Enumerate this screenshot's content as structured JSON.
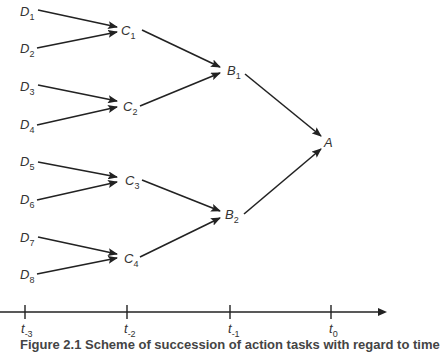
{
  "nodes": {
    "D1": {
      "base": "D",
      "sub": "1"
    },
    "D2": {
      "base": "D",
      "sub": "2"
    },
    "D3": {
      "base": "D",
      "sub": "3"
    },
    "D4": {
      "base": "D",
      "sub": "4"
    },
    "D5": {
      "base": "D",
      "sub": "5"
    },
    "D6": {
      "base": "D",
      "sub": "6"
    },
    "D7": {
      "base": "D",
      "sub": "7"
    },
    "D8": {
      "base": "D",
      "sub": "8"
    },
    "C1": {
      "base": "C",
      "sub": "1"
    },
    "C2": {
      "base": "C",
      "sub": "2"
    },
    "C3": {
      "base": "C",
      "sub": "3"
    },
    "C4": {
      "base": "C",
      "sub": "4"
    },
    "B1": {
      "base": "B",
      "sub": "1"
    },
    "B2": {
      "base": "B",
      "sub": "2"
    },
    "A": {
      "base": "A",
      "sub": ""
    }
  },
  "edges": [
    [
      "D1",
      "C1"
    ],
    [
      "D2",
      "C1"
    ],
    [
      "D3",
      "C2"
    ],
    [
      "D4",
      "C2"
    ],
    [
      "D5",
      "C3"
    ],
    [
      "D6",
      "C3"
    ],
    [
      "D7",
      "C4"
    ],
    [
      "D8",
      "C4"
    ],
    [
      "C1",
      "B1"
    ],
    [
      "C2",
      "B1"
    ],
    [
      "C3",
      "B2"
    ],
    [
      "C4",
      "B2"
    ],
    [
      "B1",
      "A"
    ],
    [
      "B2",
      "A"
    ]
  ],
  "timeline": {
    "ticks": [
      {
        "base": "t",
        "sub": "-3"
      },
      {
        "base": "t",
        "sub": "-2"
      },
      {
        "base": "t",
        "sub": "-1"
      },
      {
        "base": "t",
        "sub": "0"
      }
    ]
  },
  "caption": "Figure 2.1 Scheme of succession of action tasks with regard to time"
}
